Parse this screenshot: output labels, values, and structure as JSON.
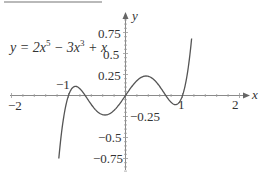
{
  "chart_data": {
    "type": "line",
    "title": "",
    "equation": {
      "prefix": "y = 2x",
      "exp1": "5",
      "mid": " − 3x",
      "exp2": "3",
      "suffix": " + x"
    },
    "xlabel": "x",
    "ylabel": "y",
    "xlim": [
      -2,
      2
    ],
    "ylim": [
      -0.9,
      0.95
    ],
    "grid": false,
    "legend": "none",
    "x_ticks": [
      {
        "value": -2,
        "label": "−2"
      },
      {
        "value": -1,
        "label": "−1"
      },
      {
        "value": 1,
        "label": "1"
      },
      {
        "value": 2,
        "label": "2"
      }
    ],
    "y_ticks": [
      {
        "value": 0.75,
        "label": "0.75"
      },
      {
        "value": 0.5,
        "label": "0.5"
      },
      {
        "value": 0.25,
        "label": "0.25"
      },
      {
        "value": -0.25,
        "label": "−0.25"
      },
      {
        "value": -0.5,
        "label": "−0.5"
      },
      {
        "value": -0.75,
        "label": "−0.75"
      }
    ],
    "series": [
      {
        "name": "y = 2x^5 − 3x^3 + x",
        "x": [
          -1.17,
          -1.1,
          -1.05,
          -1.0,
          -0.95,
          -0.9,
          -0.85,
          -0.8,
          -0.7,
          -0.6,
          -0.5,
          -0.4,
          -0.3,
          -0.2,
          -0.1,
          0.0,
          0.1,
          0.2,
          0.3,
          0.4,
          0.5,
          0.6,
          0.7,
          0.8,
          0.85,
          0.9,
          0.95,
          1.0,
          1.05,
          1.1,
          1.16
        ],
        "y": [
          -0.85,
          -0.333,
          -0.141,
          0.0,
          0.095,
          0.136,
          0.153,
          0.102,
          0.007,
          -0.107,
          -0.188,
          -0.228,
          -0.224,
          -0.177,
          -0.097,
          0.0,
          0.097,
          0.177,
          0.224,
          0.228,
          0.188,
          0.107,
          -0.007,
          -0.102,
          -0.153,
          -0.136,
          -0.095,
          0.0,
          0.141,
          0.333,
          0.85
        ]
      }
    ],
    "colors": {
      "curve": "#555555",
      "axes": "#888888",
      "text": "#333333"
    }
  },
  "labels": {
    "x_axis": "x",
    "y_axis": "y",
    "x_tick_m2": "−2",
    "x_tick_m1": "−1",
    "x_tick_1": "1",
    "x_tick_2": "2",
    "y_tick_075": "0.75",
    "y_tick_05": "0.5",
    "y_tick_025": "0.25",
    "y_tick_m025": "−0.25",
    "y_tick_m05": "−0.5",
    "y_tick_m075": "−0.75"
  }
}
